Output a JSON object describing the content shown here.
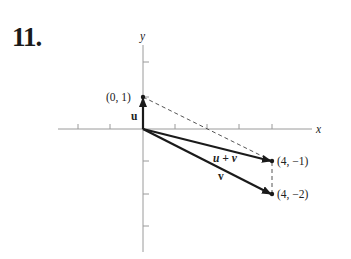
{
  "problem": {
    "number": "11."
  },
  "axes": {
    "x_label": "x",
    "y_label": "y"
  },
  "points": {
    "p01": "(0, 1)",
    "p4m1": "(4, −1)",
    "p4m2": "(4, −2)"
  },
  "vectors": {
    "u": {
      "label": "u",
      "from": [
        0,
        0
      ],
      "to": [
        0,
        1
      ]
    },
    "v": {
      "label": "v",
      "from": [
        0,
        0
      ],
      "to": [
        4,
        -2
      ]
    },
    "u_plus_v": {
      "label": "u + v",
      "from": [
        0,
        0
      ],
      "to": [
        4,
        -1
      ]
    }
  },
  "colors": {
    "ink": "#1a1a1a",
    "axis": "#9a9a9a",
    "dashed": "#555555"
  }
}
